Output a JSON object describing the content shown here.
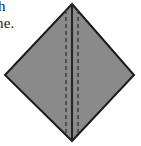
{
  "figure": {
    "caption_fragments": [
      {
        "id": "fragment-top",
        "text": "h"
      },
      {
        "id": "fragment-bottom",
        "text": "ne."
      }
    ],
    "diagram": {
      "name": "folded-paper-diamond",
      "shape": "diamond",
      "description": "Gray shaded diamond with a solid vertical fold line and two dashed crease lines",
      "fill_color": "#8a8a8a",
      "outline_color": "#1c1c1c",
      "fold_line_color": "#242424",
      "crease_line_color": "#3a3a3a",
      "background_color": "#ffffff",
      "vertices": {
        "top": {
          "x": 72,
          "y": 4
        },
        "right": {
          "x": 134,
          "y": 75
        },
        "bottom": {
          "x": 72,
          "y": 141
        },
        "left": {
          "x": 5,
          "y": 75
        }
      },
      "fold_line": {
        "x": 72,
        "y_start": 4,
        "y_end": 141,
        "style": "solid"
      },
      "crease_lines": [
        {
          "id": "crease-left",
          "x": 66,
          "y_start": 10,
          "y_end": 136,
          "style": "dashed"
        },
        {
          "id": "crease-right",
          "x": 78,
          "y_start": 10,
          "y_end": 136,
          "style": "dashed"
        }
      ],
      "outline_width": 2,
      "fold_line_width": 2,
      "crease_line_width": 1.4,
      "crease_dash_pattern": "4 3"
    }
  }
}
